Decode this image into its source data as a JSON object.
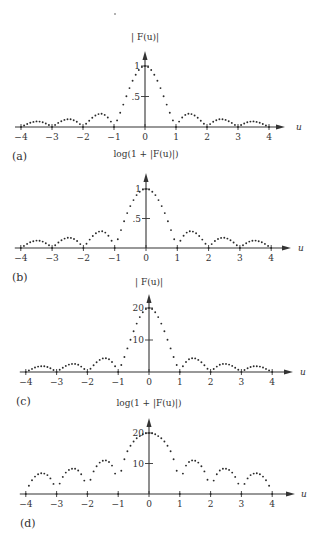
{
  "chart_data": [
    {
      "panel": "(a)",
      "type": "scatter",
      "title": "| F(u)|",
      "xlabel": "u",
      "ylabel": "",
      "xlim": [
        -4,
        4
      ],
      "xticks": [
        -4,
        -3,
        -2,
        -1,
        0,
        1,
        2,
        3,
        4
      ],
      "xtick_labels": [
        "−4",
        "−3",
        "−2",
        "−1",
        "0",
        "1",
        "2",
        "3",
        "4"
      ],
      "yticks": [
        0.5,
        1
      ],
      "ytick_labels": [
        ".5",
        "1"
      ],
      "ylim": [
        0,
        1.2
      ],
      "grid": false,
      "u_step": 0.1,
      "u_half": [
        0,
        0.1,
        0.2,
        0.3,
        0.4,
        0.5,
        0.6,
        0.7,
        0.8,
        0.9,
        1.0,
        1.1,
        1.2,
        1.3,
        1.4,
        1.5,
        1.6,
        1.7,
        1.8,
        1.9,
        2.0,
        2.1,
        2.2,
        2.3,
        2.4,
        2.5,
        2.6,
        2.7,
        2.8,
        2.9,
        3.0,
        3.1,
        3.2,
        3.3,
        3.4,
        3.5,
        3.6,
        3.7,
        3.8,
        3.9,
        4.0
      ],
      "values_half": [
        1,
        0.984,
        0.935,
        0.858,
        0.757,
        0.637,
        0.505,
        0.368,
        0.234,
        0.109,
        0,
        0.089,
        0.156,
        0.198,
        0.216,
        0.212,
        0.189,
        0.151,
        0.104,
        0.052,
        0,
        0.047,
        0.085,
        0.112,
        0.126,
        0.127,
        0.116,
        0.095,
        0.067,
        0.034,
        0,
        0.032,
        0.058,
        0.078,
        0.089,
        0.091,
        0.084,
        0.07,
        0.049,
        0.025,
        0
      ],
      "symmetric": true
    },
    {
      "panel": "(b)",
      "type": "scatter",
      "title": "log(1 + |F(u)|)",
      "xlabel": "u",
      "ylabel": "",
      "xlim": [
        -4,
        4
      ],
      "xticks": [
        -4,
        -3,
        -2,
        -1,
        0,
        1,
        2,
        3,
        4
      ],
      "xtick_labels": [
        "−4",
        "−3",
        "−2",
        "−1",
        "0",
        "1",
        "2",
        "3",
        "4"
      ],
      "yticks": [
        0.5,
        1
      ],
      "ytick_labels": [
        ".5",
        "1"
      ],
      "ylim": [
        0,
        1.25
      ],
      "grid": false,
      "u_step": 0.1,
      "values_half": [
        1,
        0.989,
        0.955,
        0.897,
        0.812,
        0.711,
        0.591,
        0.452,
        0.303,
        0.149,
        0,
        0.123,
        0.209,
        0.261,
        0.283,
        0.278,
        0.25,
        0.203,
        0.143,
        0.073,
        0,
        0.066,
        0.118,
        0.153,
        0.171,
        0.173,
        0.159,
        0.131,
        0.093,
        0.048,
        0,
        0.045,
        0.081,
        0.108,
        0.123,
        0.126,
        0.116,
        0.098,
        0.069,
        0.036,
        0
      ],
      "symmetric": true
    },
    {
      "panel": "(c)",
      "type": "scatter",
      "title": "| F(u)|",
      "xlabel": "u",
      "ylabel": "",
      "xlim": [
        -4,
        4
      ],
      "xticks": [
        -4,
        -3,
        -2,
        -1,
        0,
        1,
        2,
        3,
        4
      ],
      "xtick_labels": [
        "−4",
        "−3",
        "−2",
        "−1",
        "0",
        "1",
        "2",
        "3",
        "4"
      ],
      "yticks": [
        10,
        20
      ],
      "ytick_labels": [
        "10",
        "20"
      ],
      "ylim": [
        0,
        24
      ],
      "grid": false,
      "u_step": 0.1,
      "values_half": [
        20,
        19.68,
        18.7,
        17.16,
        15.14,
        12.74,
        10.1,
        7.36,
        4.68,
        2.18,
        0,
        1.78,
        3.12,
        3.96,
        4.32,
        4.24,
        3.78,
        3.02,
        2.08,
        1.04,
        0,
        0.94,
        1.7,
        2.24,
        2.52,
        2.54,
        2.32,
        1.9,
        1.34,
        0.68,
        0,
        0.64,
        1.16,
        1.56,
        1.78,
        1.82,
        1.68,
        1.4,
        0.98,
        0.5,
        0
      ],
      "symmetric": true
    },
    {
      "panel": "(d)",
      "type": "scatter",
      "title": "log(1 + |F(u)|)",
      "xlabel": "u",
      "ylabel": "",
      "xlim": [
        -4,
        4
      ],
      "xticks": [
        -4,
        -3,
        -2,
        -1,
        0,
        1,
        2,
        3,
        4
      ],
      "xtick_labels": [
        "−4",
        "−3",
        "−2",
        "−1",
        "0",
        "1",
        "2",
        "3",
        "4"
      ],
      "yticks": [
        10,
        20
      ],
      "ytick_labels": [
        "10",
        "20"
      ],
      "ylim": [
        0,
        26
      ],
      "grid": false,
      "u_step": 0.1,
      "values_half": [
        20,
        19.9,
        19.6,
        19.0,
        18.3,
        17.2,
        15.8,
        14.0,
        11.4,
        7.6,
        0,
        6.7,
        9.3,
        10.5,
        11.0,
        10.9,
        10.3,
        9.1,
        7.4,
        4.7,
        0,
        4.4,
        6.5,
        7.7,
        8.3,
        8.3,
        7.9,
        7.0,
        5.6,
        3.4,
        0,
        3.3,
        5.1,
        6.2,
        6.7,
        6.8,
        6.5,
        5.7,
        4.5,
        2.7,
        0
      ],
      "symmetric": true
    }
  ],
  "layout": {
    "panels": [
      {
        "title_y": 40,
        "axis_y": 127,
        "x0": 145,
        "unit_x": 31,
        "y_top_tick_y": 66,
        "y_top_tick_val": 1,
        "arrow_top": 51,
        "arrow_right": 285,
        "u_label_x": 296,
        "label_x": 12,
        "label_y": 160
      },
      {
        "title_y": 157,
        "axis_y": 248,
        "x0": 146,
        "unit_x": 31.3,
        "y_top_tick_y": 189,
        "y_top_tick_val": 1,
        "arrow_top": 173,
        "arrow_right": 291,
        "u_label_x": 298,
        "label_x": 12,
        "label_y": 281
      },
      {
        "title_y": 285,
        "axis_y": 372,
        "x0": 149,
        "unit_x": 30.8,
        "y_top_tick_y": 308,
        "y_top_tick_val": 20,
        "arrow_top": 294,
        "arrow_right": 293,
        "u_label_x": 300,
        "label_x": 16,
        "label_y": 405
      },
      {
        "title_y": 406,
        "axis_y": 494,
        "x0": 149,
        "unit_x": 30.8,
        "y_top_tick_y": 433,
        "y_top_tick_val": 20,
        "arrow_top": 418,
        "arrow_right": 295,
        "u_label_x": 301,
        "label_x": 20,
        "label_y": 527
      }
    ],
    "ink_color": "#333333",
    "dot_color": "#2a2a2a"
  }
}
